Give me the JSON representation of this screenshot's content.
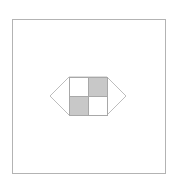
{
  "diagram": {
    "background": "#ffffff",
    "frame": {
      "x": 12,
      "y": 19,
      "width": 153,
      "height": 154,
      "stroke": "#b3b3b3"
    },
    "hexagon": {
      "points": "50,96 69,77 107,77 126,96 107,115 69,115",
      "stroke": "#bdbdbd",
      "fill": "#ffffff"
    },
    "grid": {
      "x": 69,
      "y": 77,
      "cell": 19,
      "stroke": "#a8a8a8",
      "cells": [
        {
          "row": 0,
          "col": 0,
          "fill": "#ffffff"
        },
        {
          "row": 0,
          "col": 1,
          "fill": "#c8c8c8"
        },
        {
          "row": 1,
          "col": 0,
          "fill": "#c8c8c8"
        },
        {
          "row": 1,
          "col": 1,
          "fill": "#ffffff"
        }
      ]
    }
  }
}
